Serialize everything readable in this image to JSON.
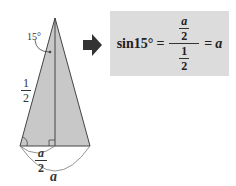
{
  "diagram": {
    "angle_label": "15°",
    "side_label": {
      "num": "1",
      "den": "2"
    },
    "half_base_label": {
      "num": "a",
      "den": "2"
    },
    "base_label": "a",
    "colors": {
      "triangle_fill": "#c8c8c8",
      "stroke": "#444444",
      "box_fill": "#dcdcdc",
      "arrow": "#333333"
    }
  },
  "formula": {
    "lhs": "sin15°",
    "equals1": "=",
    "numerator": {
      "num": "a",
      "den": "2"
    },
    "denominator": {
      "num": "1",
      "den": "2"
    },
    "equals2": "=",
    "rhs": "a"
  }
}
